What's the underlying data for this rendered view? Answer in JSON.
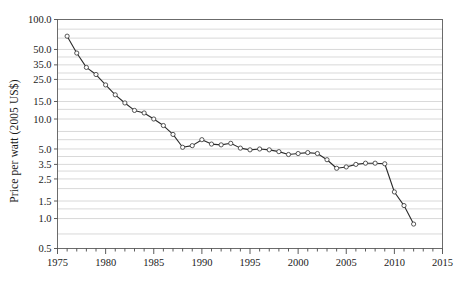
{
  "chart_data": {
    "type": "line",
    "title": "",
    "xlabel": "",
    "ylabel": "Price per watt (2005 US$)",
    "yscale": "log",
    "ylim": [
      0.5,
      100.0
    ],
    "xlim": [
      1975,
      2015
    ],
    "grid": true,
    "legend": "none",
    "y_tick_labels": [
      "100.0",
      "50.0",
      "35.0",
      "25.0",
      "15.0",
      "10.0",
      "5.0",
      "3.5",
      "2.5",
      "1.5",
      "1.0",
      "0.5"
    ],
    "y_ticks": [
      100.0,
      50.0,
      35.0,
      25.0,
      15.0,
      10.0,
      5.0,
      3.5,
      2.5,
      1.5,
      1.0,
      0.5
    ],
    "x_tick_labels": [
      "1975",
      "1980",
      "1985",
      "1990",
      "1995",
      "2000",
      "2005",
      "2010",
      "2015"
    ],
    "x_ticks": [
      1975,
      1980,
      1985,
      1990,
      1995,
      2000,
      2005,
      2010,
      2015
    ],
    "x_minor_tick_step": 1,
    "marker": "open-circle",
    "line_color": "#2b2b2b",
    "marker_fill": "#ffffff",
    "grid_color": "#c9c9c9",
    "series": [
      {
        "name": "Price per watt",
        "x": [
          1976,
          1977,
          1978,
          1979,
          1980,
          1981,
          1982,
          1983,
          1984,
          1985,
          1986,
          1987,
          1988,
          1989,
          1990,
          1991,
          1992,
          1993,
          1994,
          1995,
          1996,
          1997,
          1998,
          1999,
          2000,
          2001,
          2002,
          2003,
          2004,
          2005,
          2006,
          2007,
          2008,
          2009,
          2010,
          2011,
          2012
        ],
        "values": [
          68.0,
          46.0,
          33.0,
          28.0,
          22.0,
          17.5,
          14.5,
          12.2,
          11.5,
          10.0,
          8.6,
          7.0,
          5.2,
          5.4,
          6.2,
          5.6,
          5.5,
          5.7,
          5.1,
          4.9,
          5.0,
          4.9,
          4.7,
          4.4,
          4.5,
          4.6,
          4.5,
          3.9,
          3.2,
          3.3,
          3.5,
          3.6,
          3.6,
          3.55,
          1.85,
          1.35,
          0.88
        ]
      }
    ]
  }
}
